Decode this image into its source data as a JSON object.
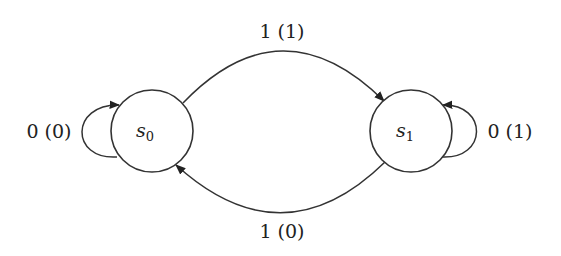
{
  "diagram": {
    "type": "finite-state-machine",
    "states": [
      {
        "id": "s0",
        "base": "s",
        "subscript": "0"
      },
      {
        "id": "s1",
        "base": "s",
        "subscript": "1"
      }
    ],
    "transitions": [
      {
        "from": "s0",
        "to": "s0",
        "label": "0 (0)"
      },
      {
        "from": "s0",
        "to": "s1",
        "label": "1 (1)"
      },
      {
        "from": "s1",
        "to": "s1",
        "label": "0 (1)"
      },
      {
        "from": "s1",
        "to": "s0",
        "label": "1 (0)"
      }
    ]
  }
}
